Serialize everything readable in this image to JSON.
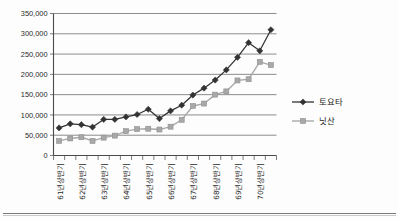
{
  "chart_data": {
    "type": "line",
    "title": "",
    "xlabel": "",
    "ylabel": "",
    "ylim": [
      0,
      350000
    ],
    "ytick_step": 50000,
    "grid": true,
    "legend_position": "right",
    "categories": [
      "61년상반기",
      "61년하반기",
      "62년상반기",
      "62년하반기",
      "63년상반기",
      "63년하반기",
      "64년상반기",
      "64년하반기",
      "65년상반기",
      "65년하반기",
      "66년상반기",
      "66년하반기",
      "67년상반기",
      "67년하반기",
      "68년상반기",
      "68년하반기",
      "69년상반기",
      "69년하반기",
      "70년상반기",
      "70년하반기"
    ],
    "xtick_labels": [
      "61년상반기",
      "62년상반기",
      "63년상반기",
      "64년상반기",
      "65년상반기",
      "66년상반기",
      "67년상반기",
      "68년상반기",
      "69년상반기",
      "70년상반기"
    ],
    "ytick_labels": [
      "0",
      "50,000",
      "100,000",
      "150,000",
      "200,000",
      "250,000",
      "300,000",
      "350,000"
    ],
    "ytick_values": [
      0,
      50000,
      100000,
      150000,
      200000,
      250000,
      300000,
      350000
    ],
    "series": [
      {
        "name": "토요타",
        "marker": "diamond",
        "color": "#333333",
        "values": [
          68000,
          78000,
          76000,
          70000,
          89000,
          89000,
          95000,
          101000,
          114000,
          91000,
          110000,
          124000,
          149000,
          166000,
          186000,
          211000,
          242000,
          278000,
          258000,
          310000
        ]
      },
      {
        "name": "닛산",
        "marker": "square",
        "color": "#a8a8a8",
        "values": [
          36000,
          42000,
          45000,
          36000,
          44000,
          49000,
          60000,
          65000,
          66000,
          64000,
          71000,
          88000,
          122000,
          128000,
          150000,
          158000,
          185000,
          188000,
          231000,
          223000
        ]
      }
    ]
  },
  "legend": {
    "items": [
      {
        "label": "토요타",
        "marker": "diamond",
        "color": "#333333"
      },
      {
        "label": "닛산",
        "marker": "square",
        "color": "#a8a8a8"
      }
    ]
  }
}
